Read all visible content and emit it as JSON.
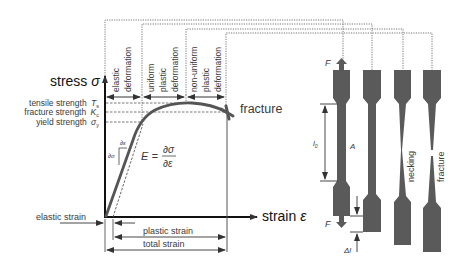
{
  "diagram": {
    "axes": {
      "y_label": "stress",
      "y_symbol": "σ",
      "x_label": "strain",
      "x_symbol": "ε"
    },
    "regions": [
      {
        "id": "elastic",
        "lines": [
          "elastic",
          "deformation"
        ]
      },
      {
        "id": "uniform",
        "lines": [
          "uniform",
          "plastic",
          "deformation"
        ]
      },
      {
        "id": "nonuniform",
        "lines": [
          "non-uniform",
          "plastic",
          "deformation"
        ]
      }
    ],
    "strength_levels": [
      {
        "label": "tensile strength",
        "symbol": "T",
        "sub": "s"
      },
      {
        "label": "fracture strength",
        "symbol": "K",
        "sub": "c"
      },
      {
        "label": "yield strength",
        "symbol": "σ",
        "sub": "y"
      }
    ],
    "fracture_label": "fracture",
    "modulus": {
      "lhs": "E =",
      "numerator": "∂σ",
      "denominator": "∂ε",
      "triangle_horizontal": "∂ε",
      "triangle_vertical": "∂σ"
    },
    "strain_labels": {
      "elastic": "elastic strain",
      "plastic": "plastic strain",
      "total": "total strain"
    },
    "specimens": {
      "force_label": "F",
      "gauge_length_label": "l",
      "gauge_length_sub": "0",
      "area_label": "A",
      "elongation_label": "Δl",
      "necking_label": "necking",
      "fracture_label": "fracture"
    },
    "colors": {
      "curve": "#555555",
      "specimen": "#5a5a5a",
      "axis": "#111111",
      "dotted": "#777777",
      "text": "#3a3a3a"
    }
  }
}
